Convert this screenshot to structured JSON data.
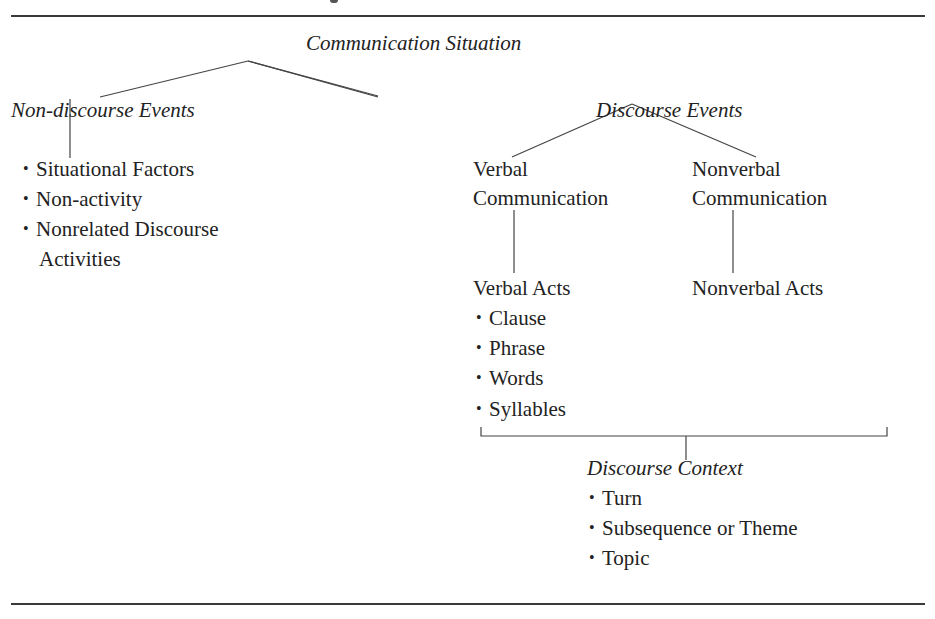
{
  "diagram": {
    "root": "Communication Situation",
    "left_branch": {
      "title": "Non-discourse Events",
      "items": [
        "Situational Factors",
        "Non-activity",
        "Nonrelated Discourse",
        "Activities"
      ]
    },
    "right_branch": {
      "title": "Discourse Events",
      "verbal": {
        "title_line1": "Verbal",
        "title_line2": "Communication",
        "acts": "Verbal Acts",
        "items": [
          "Clause",
          "Phrase",
          "Words",
          "Syllables"
        ]
      },
      "nonverbal": {
        "title_line1": "Nonverbal",
        "title_line2": "Communication",
        "acts": "Nonverbal Acts"
      },
      "context": {
        "title": "Discourse Context",
        "items": [
          "Turn",
          "Subsequence or Theme",
          "Topic"
        ]
      }
    }
  }
}
